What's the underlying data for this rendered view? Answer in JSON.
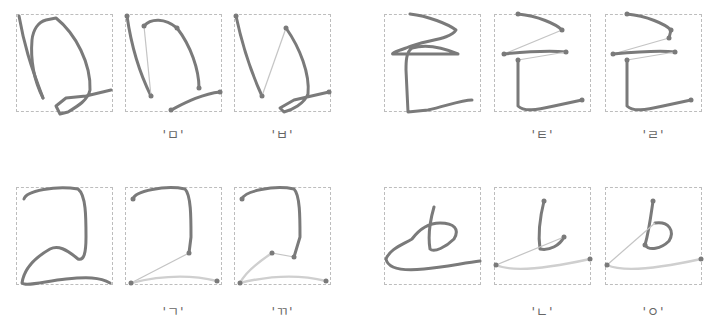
{
  "figure": {
    "groups": [
      {
        "position": "top-left",
        "panels": [
          {
            "role": "input-trajectory",
            "label": ""
          },
          {
            "role": "segmented",
            "label": "'ㅁ'"
          },
          {
            "role": "segmented",
            "label": "'ㅂ'"
          }
        ]
      },
      {
        "position": "top-right",
        "panels": [
          {
            "role": "input-trajectory",
            "label": ""
          },
          {
            "role": "segmented",
            "label": "'ㅌ'"
          },
          {
            "role": "segmented",
            "label": "'ㄹ'"
          }
        ]
      },
      {
        "position": "bottom-left",
        "panels": [
          {
            "role": "input-trajectory",
            "label": ""
          },
          {
            "role": "segmented",
            "label": "'ㄱ'"
          },
          {
            "role": "segmented",
            "label": "'ㄲ'"
          }
        ]
      },
      {
        "position": "bottom-right",
        "panels": [
          {
            "role": "input-trajectory",
            "label": ""
          },
          {
            "role": "segmented",
            "label": "'ㄴ'"
          },
          {
            "role": "segmented",
            "label": "'ㅇ'"
          }
        ]
      }
    ],
    "colors": {
      "stroke": "#7a7a7a",
      "connector": "#c4c4c4",
      "panel_border": "#bdbdbd"
    }
  }
}
